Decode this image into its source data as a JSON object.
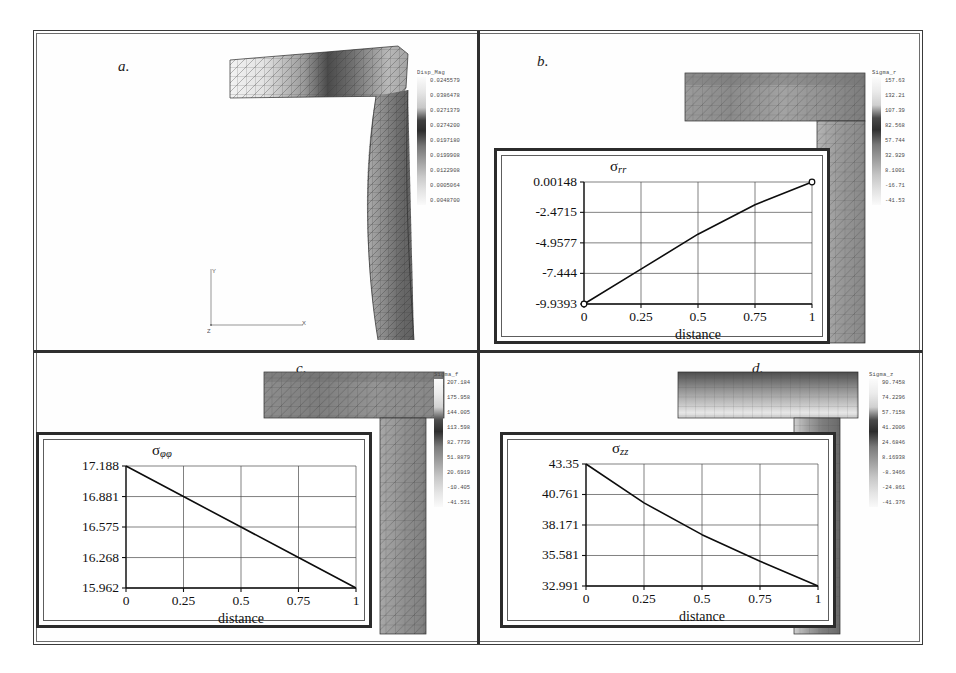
{
  "figure": {
    "panels": [
      {
        "letter": "a.",
        "legend_title": "Disp_Mag",
        "legend_ticks": [
          "0.0245579",
          "0.0386478",
          "0.0271379",
          "0.0274200",
          "0.0197180",
          "0.0199908",
          "0.0122908",
          "0.0005064",
          "0.0048700"
        ],
        "axis_triad": {
          "x": "X",
          "y": "Y",
          "z": "Z"
        }
      },
      {
        "letter": "b.",
        "legend_title": "Sigma_r",
        "legend_ticks": [
          "157.63",
          "132.21",
          "107.39",
          "82.568",
          "57.744",
          "32.929",
          "8.1001",
          "-16.71",
          "-41.53"
        ]
      },
      {
        "letter": "c.",
        "legend_title": "Sigma_f",
        "legend_ticks": [
          "207.184",
          "175.958",
          "144.005",
          "113.598",
          "82.7739",
          "51.8879",
          "20.6919",
          "-10.405",
          "-41.531"
        ]
      },
      {
        "letter": "d.",
        "legend_title": "Sigma_z",
        "legend_ticks": [
          "90.7458",
          "74.2296",
          "57.7158",
          "41.2006",
          "24.6846",
          "8.16938",
          "-8.3466",
          "-24.861",
          "-41.376"
        ]
      }
    ]
  },
  "chart_data": [
    {
      "type": "line",
      "panel": "b",
      "title": "σ",
      "title_sub": "rr",
      "xlabel": "distance",
      "ylabel": "",
      "x": [
        0,
        0.25,
        0.5,
        0.75,
        1
      ],
      "y": [
        -9.9393,
        -7.1,
        -4.25,
        -1.85,
        0.00148
      ],
      "xticks": [
        "0",
        "0.25",
        "0.5",
        "0.75",
        "1"
      ],
      "xtickvals": [
        0,
        0.25,
        0.5,
        0.75,
        1
      ],
      "yticks": [
        "0.00148",
        "-2.4715",
        "-4.9577",
        "-7.444",
        "-9.9393"
      ],
      "ytickvals": [
        0.00148,
        -2.4715,
        -4.9577,
        -7.444,
        -9.9393
      ],
      "ylim": [
        -9.9393,
        0.00148
      ],
      "xlim": [
        0,
        1
      ],
      "grid": true,
      "markers": [
        "start",
        "end"
      ]
    },
    {
      "type": "line",
      "panel": "c",
      "title": "σ",
      "title_sub": "φφ",
      "xlabel": "distance",
      "ylabel": "",
      "x": [
        0,
        0.25,
        0.5,
        0.75,
        1
      ],
      "y": [
        17.188,
        16.881,
        16.575,
        16.268,
        15.962
      ],
      "xticks": [
        "0",
        "0.25",
        "0.5",
        "0.75",
        "1"
      ],
      "xtickvals": [
        0,
        0.25,
        0.5,
        0.75,
        1
      ],
      "yticks": [
        "17.188",
        "16.881",
        "16.575",
        "16.268",
        "15.962"
      ],
      "ytickvals": [
        17.188,
        16.881,
        16.575,
        16.268,
        15.962
      ],
      "ylim": [
        15.962,
        17.188
      ],
      "xlim": [
        0,
        1
      ],
      "grid": true,
      "markers": []
    },
    {
      "type": "line",
      "panel": "d",
      "title": "σ",
      "title_sub": "zz",
      "xlabel": "distance",
      "ylabel": "",
      "x": [
        0,
        0.25,
        0.5,
        0.75,
        1
      ],
      "y": [
        43.35,
        40.05,
        37.35,
        35.1,
        32.991
      ],
      "xticks": [
        "0",
        "0.25",
        "0.5",
        "0.75",
        "1"
      ],
      "xtickvals": [
        0,
        0.25,
        0.5,
        0.75,
        1
      ],
      "yticks": [
        "43.35",
        "40.761",
        "38.171",
        "35.581",
        "32.991"
      ],
      "ytickvals": [
        43.35,
        40.761,
        38.171,
        35.581,
        32.991
      ],
      "ylim": [
        32.991,
        43.35
      ],
      "xlim": [
        0,
        1
      ],
      "grid": true,
      "markers": []
    }
  ]
}
